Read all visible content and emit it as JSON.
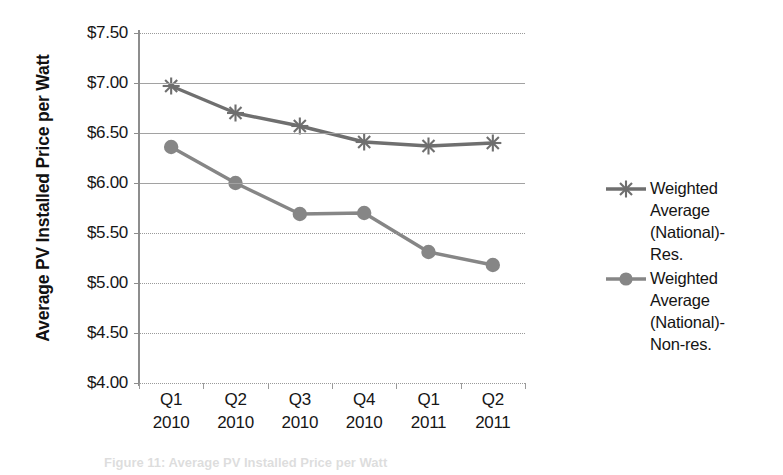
{
  "chart_data": {
    "type": "line",
    "title": "",
    "xlabel": "",
    "ylabel": "Average PV Installed Price per Watt",
    "categories": [
      "Q1 2010",
      "Q2 2010",
      "Q3 2010",
      "Q4 2010",
      "Q1 2011",
      "Q2 2011"
    ],
    "category_lines": [
      [
        "Q1",
        "2010"
      ],
      [
        "Q2",
        "2010"
      ],
      [
        "Q3",
        "2010"
      ],
      [
        "Q4",
        "2010"
      ],
      [
        "Q1",
        "2011"
      ],
      [
        "Q2",
        "2011"
      ]
    ],
    "ylim": [
      4.0,
      7.5
    ],
    "ytick_values": [
      7.5,
      7.0,
      6.5,
      6.0,
      5.5,
      5.0,
      4.5,
      4.0
    ],
    "ytick_labels": [
      "$7.50",
      "$7.00",
      "$6.50",
      "$6.00",
      "$5.50",
      "$5.00",
      "$4.50",
      "$4.00"
    ],
    "grid": true,
    "legend_position": "right",
    "series": [
      {
        "name": "Weighted Average (National)-Res.",
        "marker": "asterisk",
        "color": "#6f6f6f",
        "values": [
          6.97,
          6.7,
          6.57,
          6.41,
          6.37,
          6.4
        ]
      },
      {
        "name": "Weighted Average (National)-Non-res.",
        "marker": "circle",
        "color": "#868686",
        "values": [
          6.36,
          6.0,
          5.69,
          5.7,
          5.31,
          5.18
        ]
      }
    ]
  },
  "legend": {
    "entries": [
      {
        "label": "Weighted\nAverage\n(National)-\nRes.",
        "marker": "asterisk"
      },
      {
        "label": "Weighted\nAverage\n(National)-\nNon-res.",
        "marker": "circle"
      }
    ]
  },
  "caption": {
    "text": "Figure 11: Average PV Installed Price per Watt"
  },
  "colors": {
    "series_res": "#6f6f6f",
    "series_nonres": "#868686",
    "gridline": "#9a9a9a",
    "axis": "#8d8d8d",
    "text": "#161616"
  }
}
